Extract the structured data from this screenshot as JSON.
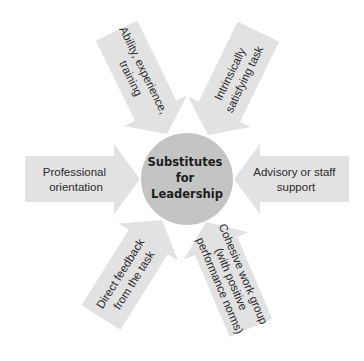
{
  "diagram": {
    "center": {
      "lines": [
        "Substitutes",
        "for",
        "Leadership"
      ]
    },
    "arrows": [
      {
        "id": "ability",
        "lines": [
          "Ability, experience,",
          "training"
        ],
        "position": "upper-left"
      },
      {
        "id": "intrinsic",
        "lines": [
          "Intrinsically",
          "satisfying task"
        ],
        "position": "upper-right"
      },
      {
        "id": "professional",
        "lines": [
          "Professional",
          "orientation"
        ],
        "position": "left"
      },
      {
        "id": "advisory",
        "lines": [
          "Advisory or staff",
          "support"
        ],
        "position": "right"
      },
      {
        "id": "feedback",
        "lines": [
          "Direct feedback",
          "from the task"
        ],
        "position": "lower-left"
      },
      {
        "id": "cohesive",
        "lines": [
          "Cohesive work group",
          "(with positive",
          "performance norms)"
        ],
        "position": "lower-right"
      }
    ],
    "colors": {
      "background": "#ffffff",
      "arrow": "#e2e2e2",
      "hub": "#c4c4c4",
      "text": "#2a2a2a"
    }
  }
}
